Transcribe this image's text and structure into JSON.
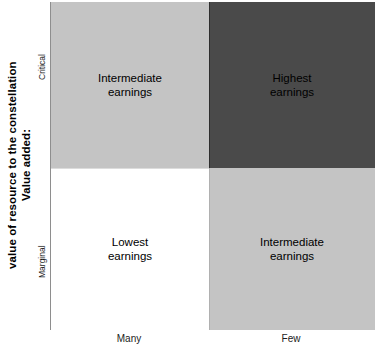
{
  "chart_data": {
    "type": "heatmap",
    "title": "",
    "xlabel": "",
    "ylabel": "Value added: value of resource to the constellation",
    "grid": false,
    "legend": "none",
    "x_axis": {
      "name": "alternative-sources",
      "categories": [
        "Many",
        "Few"
      ]
    },
    "y_axis": {
      "title_line_1": "Value added:",
      "title_line_2": "value of resource to the constellation",
      "categories": [
        "Marginal",
        "Critical"
      ],
      "tick_top": "Critical",
      "tick_bottom": "Marginal"
    },
    "cells": [
      {
        "row": "Critical",
        "column": "Many",
        "label": "Intermediate\nearnings",
        "value": 2,
        "fill": "#c4c4c4",
        "text_color": "#000000"
      },
      {
        "row": "Critical",
        "column": "Few",
        "label": "Highest\nearnings",
        "value": 3,
        "fill": "#4a4a4a",
        "text_color": "#000000"
      },
      {
        "row": "Marginal",
        "column": "Many",
        "label": "Lowest\nearnings",
        "value": 1,
        "fill": "#ffffff",
        "text_color": "#000000"
      },
      {
        "row": "Marginal",
        "column": "Few",
        "label": "Intermediate\nearnings",
        "value": 2,
        "fill": "#c4c4c4",
        "text_color": "#000000"
      }
    ],
    "values": [
      [
        2,
        3
      ],
      [
        1,
        2
      ]
    ],
    "value_scale": [
      "Lowest earnings",
      "Intermediate earnings",
      "Highest earnings"
    ],
    "colors": {
      "lowest": "#ffffff",
      "intermediate": "#c4c4c4",
      "highest": "#4a4a4a",
      "axis_line": "#8e8e8e",
      "text": "#000000"
    }
  }
}
